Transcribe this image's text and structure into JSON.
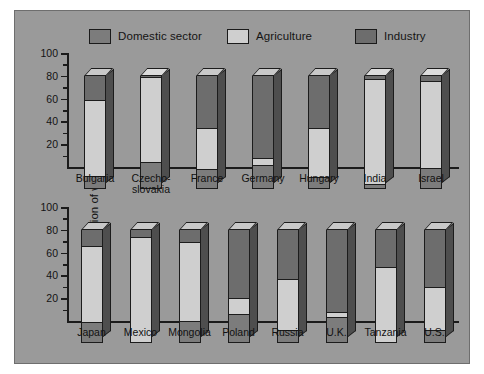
{
  "chart_data": {
    "type": "bar",
    "title": "",
    "subtitle": "",
    "xlabel": "",
    "ylabel": "Distribution of withdrawals (%)",
    "ylim": [
      0,
      100
    ],
    "yticks": [
      20,
      40,
      60,
      80,
      100
    ],
    "ytick_labels": [
      "20",
      "40",
      "60",
      "80",
      "100"
    ],
    "grid": false,
    "stacked": true,
    "legend_position": "top",
    "legend": [
      "Domestic sector",
      "Agriculture",
      "Industry"
    ],
    "series": [
      {
        "name": "Domestic sector",
        "color": "#7c7c7c",
        "values": [
          10,
          22,
          16,
          20,
          9,
          3,
          17,
          17,
          0,
          18,
          24,
          10,
          21,
          0,
          10
        ]
      },
      {
        "name": "Agriculture",
        "color": "#cfcfcf",
        "values": [
          68,
          76,
          37,
          6,
          44,
          93,
          78,
          68,
          93,
          70,
          14,
          45,
          5,
          66,
          38
        ]
      },
      {
        "name": "Industry",
        "color": "#6d6d6d",
        "values": [
          22,
          2,
          47,
          74,
          47,
          4,
          5,
          15,
          7,
          12,
          62,
          45,
          74,
          34,
          52
        ]
      }
    ],
    "rows": [
      {
        "categories": [
          "Bulgaria",
          "Czecho-\nslovakia",
          "France",
          "Germany",
          "Hungary",
          "India",
          "Israel"
        ],
        "start_index": 0,
        "count": 7
      },
      {
        "categories": [
          "Japan",
          "Mexico",
          "Mongolia",
          "Poland",
          "Russia",
          "U.K.",
          "Tanzania",
          "U.S."
        ],
        "start_index": 7,
        "count": 8
      }
    ],
    "categories": [
      "Bulgaria",
      "Czecho-slovakia",
      "France",
      "Germany",
      "Hungary",
      "India",
      "Israel",
      "Japan",
      "Mexico",
      "Mongolia",
      "Poland",
      "Russia",
      "U.K.",
      "Tanzania",
      "U.S."
    ]
  },
  "figure": {
    "background_color": "#9a9a9a",
    "border_color": "#6e6e6e"
  }
}
